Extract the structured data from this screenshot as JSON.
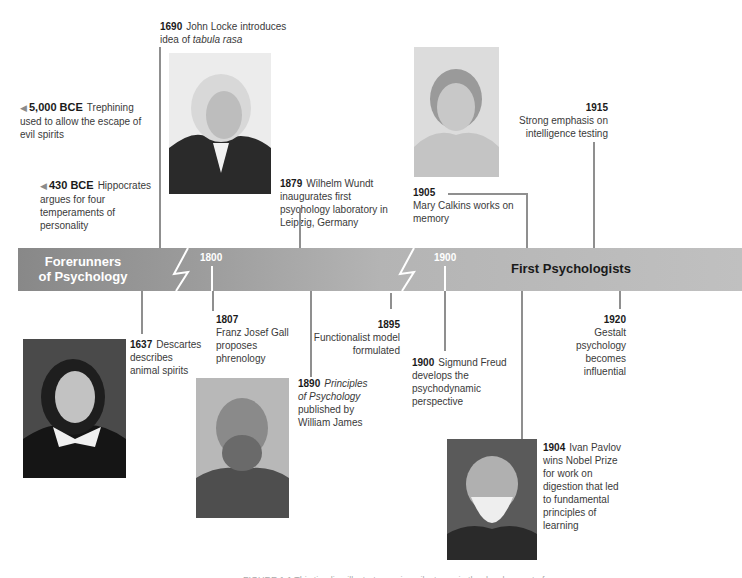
{
  "bar": {
    "left_title_line1": "Forerunners",
    "left_title_line2": "of Psychology",
    "right_title": "First Psychologists",
    "year_1800": "1800",
    "year_1900": "1900",
    "colors": {
      "dark": "#888888",
      "light": "#c0c0c0",
      "connector": "#8f8f8f"
    }
  },
  "events_above": [
    {
      "year": "1690",
      "text_before": "John Locke introduces",
      "text_line2": "idea of ",
      "italic": "tabula rasa"
    },
    {
      "year": "5,000 BCE",
      "text": "Trephining used to allow the escape of evil spirits"
    },
    {
      "year": "430 BCE",
      "text": "Hippocrates argues for four temperaments of personality"
    },
    {
      "year": "1879",
      "text": "Wilhelm Wundt inaugurates first psychology laboratory in Leipzig, Germany"
    },
    {
      "year": "1905",
      "text": "Mary Calkins works on memory"
    },
    {
      "year": "1915",
      "text": "Strong emphasis on intelligence testing"
    }
  ],
  "events_below": [
    {
      "year": "1637",
      "text": "Descartes describes animal spirits"
    },
    {
      "year": "1807",
      "text": "Franz Josef Gall proposes phrenology"
    },
    {
      "year": "1890",
      "italic": "Principles of Psychology",
      "text": "published by William James"
    },
    {
      "year": "1895",
      "text": "Functionalist model formulated"
    },
    {
      "year": "1900",
      "text": "Sigmund Freud develops the psychodynamic perspective"
    },
    {
      "year": "1904",
      "text": "Ivan Pavlov wins Nobel Prize for work on digestion that led to fundamental principles of learning"
    },
    {
      "year": "1920",
      "text": "Gestalt psychology becomes influential"
    }
  ],
  "portraits": {
    "locke": "John Locke portrait",
    "calkins": "Mary Calkins portrait",
    "descartes": "René Descartes portrait",
    "james": "William James portrait",
    "pavlov": "Ivan Pavlov portrait"
  },
  "caption": "FIGURE 1.1 This timeline illustrates major milestones in the development of psychology"
}
